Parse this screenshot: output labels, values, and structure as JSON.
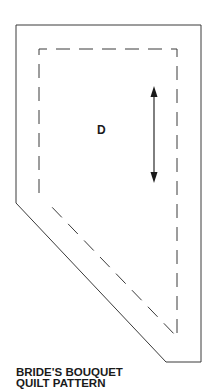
{
  "pattern": {
    "piece_label": "D",
    "title_line1": "BRIDE'S BOUQUET",
    "title_line2": "QUILT PATTERN"
  },
  "shape": {
    "outer_outline": "solid cutting line",
    "inner_outline": "dashed sewing line",
    "grain_arrow": "double-headed vertical arrow",
    "stroke_color": "#333333"
  }
}
